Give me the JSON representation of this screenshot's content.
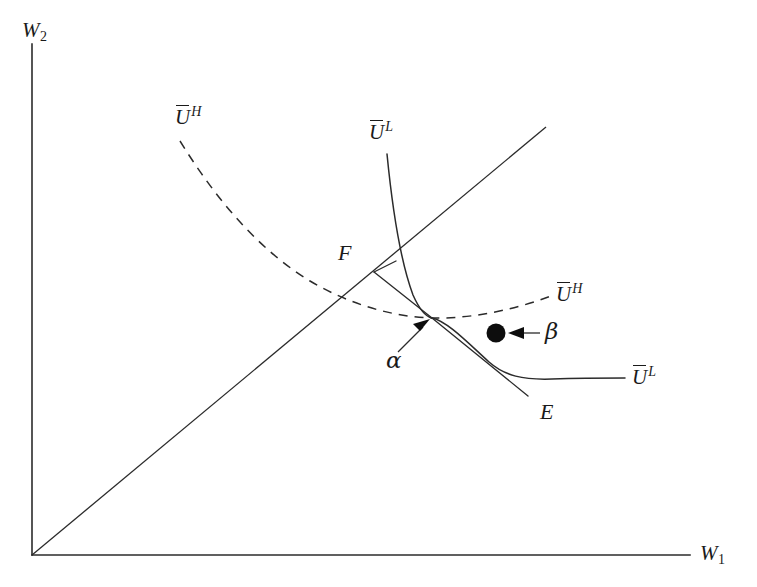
{
  "figure": {
    "type": "economics-indifference-curve-diagram",
    "background_color": "#ffffff",
    "ink_color": "#2b2b2b"
  },
  "axes": {
    "y_axis_label": "W",
    "y_axis_subscript": "2",
    "x_axis_label": "W",
    "x_axis_subscript": "1",
    "origin": {
      "x": 32,
      "y": 555
    },
    "y_axis_top": {
      "x": 32,
      "y": 44
    },
    "x_axis_right": {
      "x": 690,
      "y": 555
    }
  },
  "forty_five_degree_line": {
    "name": "45-degree-certainty-line",
    "from": {
      "x": 32,
      "y": 555
    },
    "to": {
      "x": 546,
      "y": 127
    }
  },
  "curves": [
    {
      "id": "u-high",
      "style": "dashed",
      "label": "U",
      "label_superscript": "H",
      "label_left": {
        "x": 175,
        "y": 106
      },
      "label_right": {
        "x": 557,
        "y": 283
      },
      "description": "High-type indifference curve, flat through alpha"
    },
    {
      "id": "u-low",
      "style": "solid",
      "label": "U",
      "label_superscript": "L",
      "label_top": {
        "x": 369,
        "y": 121
      },
      "label_right": {
        "x": 632,
        "y": 366
      },
      "description": "Low-type indifference curve, steep through alpha"
    }
  ],
  "points": [
    {
      "id": "alpha",
      "label": "α",
      "label_x": 386,
      "label_y": 350,
      "marker": "arrow",
      "target": {
        "x": 432,
        "y": 318
      },
      "description": "Pooling/separating allocation at curve intersection"
    },
    {
      "id": "beta",
      "label": "β",
      "label_x": 545,
      "label_y": 322,
      "marker": "filled-dot",
      "dot": {
        "x": 496,
        "y": 333,
        "radius": 9
      },
      "description": "Allocation point below U-high curve"
    },
    {
      "id": "F",
      "label": "F",
      "label_x": 338,
      "label_y": 243,
      "vertex": {
        "x": 374,
        "y": 272
      },
      "description": "Endowment/feasible point, apex of segment pair"
    },
    {
      "id": "E",
      "label": "E",
      "label_x": 540,
      "label_y": 402,
      "end": {
        "x": 528,
        "y": 396
      },
      "description": "Lower endpoint of the line through alpha"
    }
  ],
  "segments": [
    {
      "id": "F-to-alpha",
      "from": {
        "x": 374,
        "y": 272
      },
      "to": {
        "x": 432,
        "y": 318
      }
    },
    {
      "id": "alpha-to-E",
      "from": {
        "x": 432,
        "y": 318
      },
      "to": {
        "x": 528,
        "y": 396
      }
    },
    {
      "id": "F-stub",
      "from": {
        "x": 374,
        "y": 272
      },
      "to": {
        "x": 395,
        "y": 262
      }
    }
  ]
}
